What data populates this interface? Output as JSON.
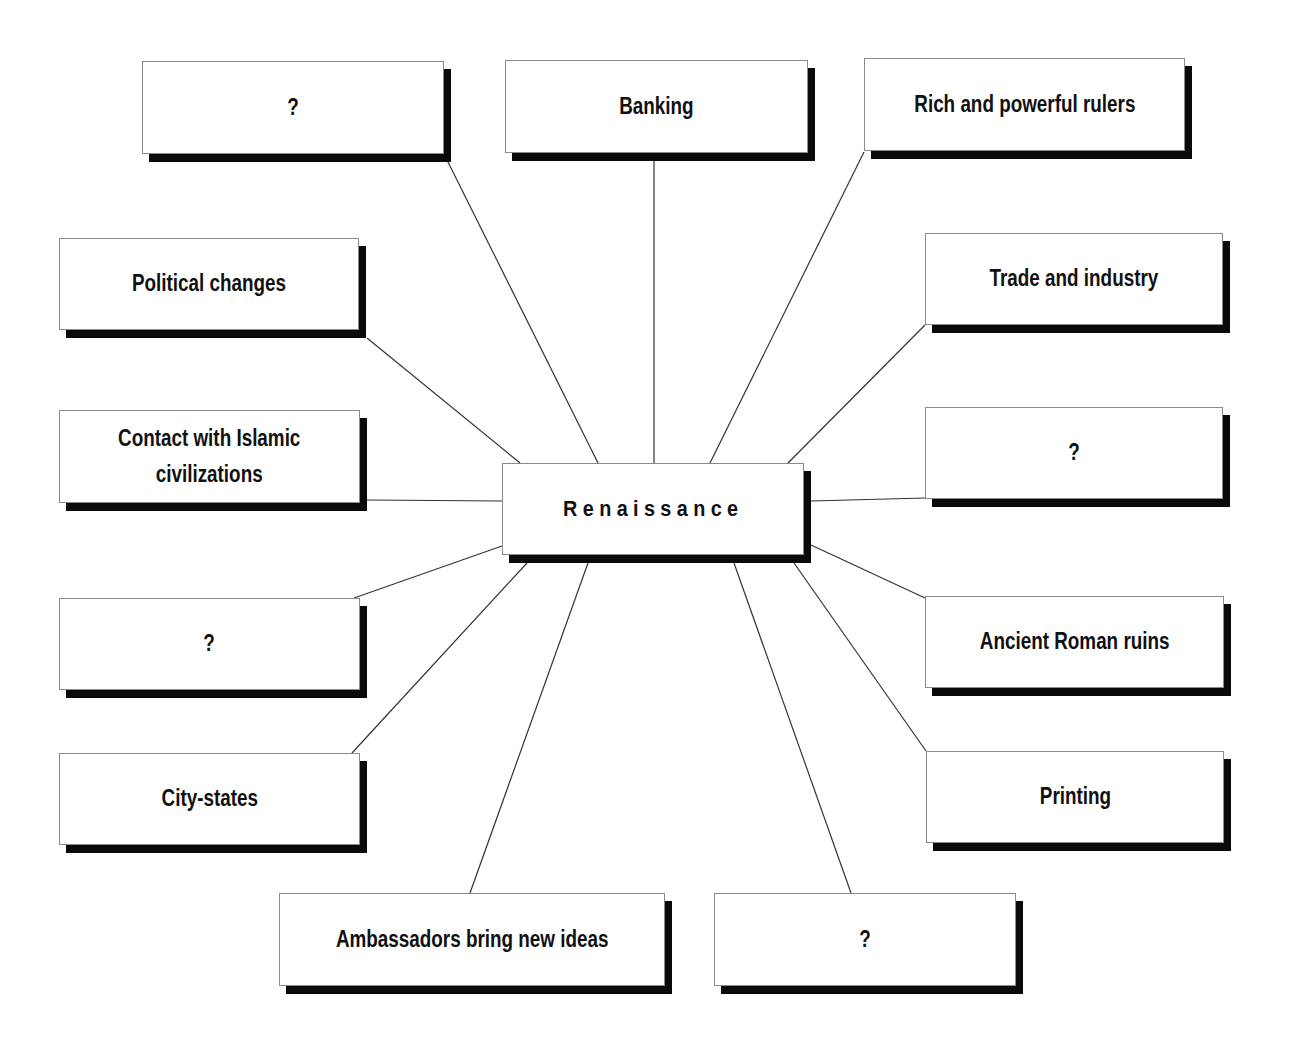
{
  "diagram": {
    "center": {
      "label": "Renaissance",
      "x": 502,
      "y": 463,
      "w": 302,
      "h": 92
    },
    "nodes": [
      {
        "id": "top-left-unknown",
        "label": "?",
        "x": 142,
        "y": 61,
        "w": 302,
        "h": 93,
        "anchor": [
          446,
          158
        ],
        "target": [
          598,
          463
        ]
      },
      {
        "id": "banking",
        "label": "Banking",
        "x": 505,
        "y": 60,
        "w": 303,
        "h": 93,
        "anchor": [
          654,
          160
        ],
        "target": [
          654,
          463
        ]
      },
      {
        "id": "rich-rulers",
        "label": "Rich and powerful rulers",
        "x": 864,
        "y": 58,
        "w": 321,
        "h": 93,
        "anchor": [
          864,
          152
        ],
        "target": [
          710,
          463
        ]
      },
      {
        "id": "political-changes",
        "label": "Political changes",
        "x": 59,
        "y": 238,
        "w": 300,
        "h": 92,
        "anchor": [
          367,
          338
        ],
        "target": [
          520,
          463
        ]
      },
      {
        "id": "trade-industry",
        "label": "Trade and industry",
        "x": 925,
        "y": 233,
        "w": 298,
        "h": 92,
        "anchor": [
          925,
          325
        ],
        "target": [
          788,
          463
        ]
      },
      {
        "id": "contact-islamic",
        "label": "Contact with Islamic\ncivilizations",
        "x": 59,
        "y": 410,
        "w": 301,
        "h": 93,
        "anchor": [
          367,
          500
        ],
        "target": [
          502,
          501
        ]
      },
      {
        "id": "right-unknown",
        "label": "?",
        "x": 925,
        "y": 407,
        "w": 298,
        "h": 92,
        "anchor": [
          925,
          498
        ],
        "target": [
          811,
          501
        ]
      },
      {
        "id": "left-unknown",
        "label": "?",
        "x": 59,
        "y": 598,
        "w": 301,
        "h": 92,
        "anchor": [
          354,
          598
        ],
        "target": [
          502,
          546
        ]
      },
      {
        "id": "ancient-roman-ruins",
        "label": "Ancient Roman ruins",
        "x": 925,
        "y": 596,
        "w": 299,
        "h": 92,
        "anchor": [
          925,
          598
        ],
        "target": [
          811,
          545
        ]
      },
      {
        "id": "city-states",
        "label": "City-states",
        "x": 59,
        "y": 753,
        "w": 301,
        "h": 92,
        "anchor": [
          352,
          753
        ],
        "target": [
          527,
          563
        ]
      },
      {
        "id": "printing",
        "label": "Printing",
        "x": 926,
        "y": 751,
        "w": 298,
        "h": 92,
        "anchor": [
          926,
          751
        ],
        "target": [
          794,
          563
        ]
      },
      {
        "id": "ambassadors",
        "label": "Ambassadors bring new ideas",
        "x": 279,
        "y": 893,
        "w": 386,
        "h": 93,
        "anchor": [
          470,
          893
        ],
        "target": [
          588,
          563
        ]
      },
      {
        "id": "bottom-unknown",
        "label": "?",
        "x": 714,
        "y": 893,
        "w": 302,
        "h": 93,
        "anchor": [
          851,
          893
        ],
        "target": [
          734,
          563
        ]
      }
    ],
    "colors": {
      "box_fill": "#ffffff",
      "box_border": "#8a8a8a",
      "shadow": "#0a0a0a",
      "line": "#333333",
      "text": "#111111"
    }
  }
}
